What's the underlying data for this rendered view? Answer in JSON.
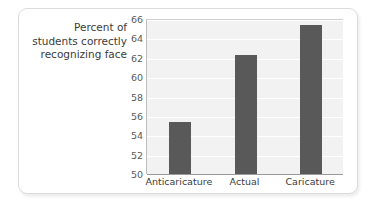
{
  "chart_data": {
    "type": "bar",
    "title": "",
    "subtitle": "",
    "xlabel": "",
    "ylabel": "Percent of students correctly recognizing face",
    "ylabel_lines": [
      "Percent of",
      "students correctly",
      "recognizing face"
    ],
    "categories": [
      "Anticaricature",
      "Actual",
      "Caricature"
    ],
    "values": [
      55.4,
      62.3,
      65.4
    ],
    "ylim": [
      50,
      66
    ],
    "ytick_step": 2,
    "yticks": [
      50,
      52,
      54,
      56,
      58,
      60,
      62,
      64,
      66
    ],
    "ytick_labels": [
      "50",
      "52",
      "54",
      "56",
      "58",
      "60",
      "62",
      "64",
      "66"
    ],
    "grid": true,
    "legend": false,
    "legend_position": "none",
    "bar_color": "#595959",
    "plot_background": "#f2f2f2",
    "gridline_color": "#ffffff",
    "axis_color": "#9a9a9a",
    "tick_label_color": "#5a5a5a",
    "axis_title_color": "#3b3b3b",
    "card_background": "#ffffff",
    "card_border_color": "#dcdcdc",
    "page_background": "#ffffff"
  }
}
